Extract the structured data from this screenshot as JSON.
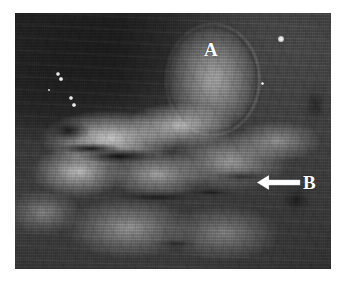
{
  "figure": {
    "domain": "medical-gross-photograph",
    "kind": "grayscale intraoperative photograph",
    "canvas": {
      "width": 346,
      "height": 282,
      "background_hex": "#FFFFFF"
    },
    "photo": {
      "x": 15,
      "y": 13,
      "width": 316,
      "height": 256,
      "tone": "grayscale",
      "dominant_hex": "#8A8A8A",
      "dark_region_hex": "#1E1E1E",
      "light_region_hex": "#DCDCDC",
      "mid_region_hex": "#9C9C9C"
    },
    "annotations": [
      {
        "id": "label-a",
        "text": "A",
        "color_hex": "#FFFFFF",
        "x": 204,
        "y": 40,
        "points_to": "round smooth nodular mass in upper-right of field",
        "marker": "letter-only"
      },
      {
        "id": "label-b",
        "text": "B",
        "color_hex": "#FFFFFF",
        "x": 303,
        "y": 173,
        "points_to": "lobulated tissue mass in mid-right of field",
        "marker": "left-pointing-arrow"
      }
    ],
    "arrow": {
      "id": "arrow-b",
      "color_hex": "#FFFFFF",
      "direction": "left",
      "tail_x": 301,
      "tail_y": 183,
      "head_x": 256,
      "head_y": 183,
      "shaft_thickness_px": 5,
      "head_width_px": 14,
      "head_height_px": 17
    },
    "specular_highlights": [
      {
        "x": 58,
        "y": 74,
        "r": 2.2
      },
      {
        "x": 61,
        "y": 79,
        "r": 1.6
      },
      {
        "x": 71,
        "y": 98,
        "r": 2.0
      },
      {
        "x": 74,
        "y": 105,
        "r": 1.8
      },
      {
        "x": 49,
        "y": 90,
        "r": 1.3
      },
      {
        "x": 281,
        "y": 39,
        "r": 2.6
      },
      {
        "x": 262,
        "y": 83,
        "r": 1.5
      }
    ]
  }
}
